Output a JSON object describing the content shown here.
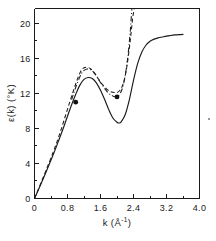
{
  "chart_data": {
    "type": "line",
    "title": "",
    "subtitle": "",
    "xlabel": "k (Å⁻¹)",
    "ylabel": "ε(k) (°K)",
    "xlabel_main": "k (Å",
    "xlabel_sup": "-1",
    "xlabel_tail": ")",
    "ylabel_main": "ε(k)  (°K)",
    "xlim": [
      0,
      4.0
    ],
    "ylim": [
      0,
      21.7
    ],
    "grid": false,
    "legend": "none",
    "xticks": [
      0,
      0.8,
      1.6,
      2.4,
      3.2,
      4.0
    ],
    "xticklabels": [
      "0",
      "0.8",
      "1.6",
      "2.4",
      "3.2",
      "4.0"
    ],
    "yticks": [
      0,
      4,
      8,
      12,
      16,
      20
    ],
    "yticklabels": [
      "0",
      "4",
      "8",
      "12",
      "16",
      "20"
    ],
    "minor_xticks": [
      0.4,
      1.2,
      2.0,
      2.8,
      3.6
    ],
    "minor_yticks": [
      2,
      6,
      10,
      14,
      18
    ],
    "series": [
      {
        "name": "solid-curve",
        "style": "solid",
        "points": [
          [
            0.0,
            0.0
          ],
          [
            0.1,
            1.05
          ],
          [
            0.2,
            2.15
          ],
          [
            0.3,
            3.25
          ],
          [
            0.4,
            4.4
          ],
          [
            0.5,
            5.55
          ],
          [
            0.6,
            6.8
          ],
          [
            0.7,
            8.05
          ],
          [
            0.8,
            9.4
          ],
          [
            0.9,
            10.7
          ],
          [
            1.0,
            11.9
          ],
          [
            1.1,
            12.95
          ],
          [
            1.2,
            13.6
          ],
          [
            1.3,
            13.82
          ],
          [
            1.4,
            13.7
          ],
          [
            1.5,
            13.2
          ],
          [
            1.6,
            12.35
          ],
          [
            1.7,
            11.3
          ],
          [
            1.8,
            10.15
          ],
          [
            1.9,
            9.2
          ],
          [
            2.0,
            8.7
          ],
          [
            2.05,
            8.62
          ],
          [
            2.1,
            8.75
          ],
          [
            2.2,
            9.6
          ],
          [
            2.3,
            11.3
          ],
          [
            2.4,
            13.5
          ],
          [
            2.5,
            15.4
          ],
          [
            2.6,
            16.7
          ],
          [
            2.7,
            17.5
          ],
          [
            2.8,
            17.95
          ],
          [
            2.9,
            18.2
          ],
          [
            3.0,
            18.35
          ],
          [
            3.1,
            18.45
          ],
          [
            3.2,
            18.55
          ],
          [
            3.3,
            18.62
          ],
          [
            3.4,
            18.68
          ],
          [
            3.5,
            18.72
          ],
          [
            3.6,
            18.75
          ]
        ]
      },
      {
        "name": "dashed-curve",
        "style": "dashed",
        "points": [
          [
            0.0,
            0.0
          ],
          [
            0.15,
            1.7
          ],
          [
            0.3,
            3.45
          ],
          [
            0.45,
            5.25
          ],
          [
            0.55,
            6.55
          ],
          [
            0.65,
            7.95
          ],
          [
            0.75,
            9.45
          ],
          [
            0.85,
            10.95
          ],
          [
            0.95,
            12.4
          ],
          [
            1.05,
            13.75
          ],
          [
            1.15,
            14.75
          ],
          [
            1.25,
            15.0
          ],
          [
            1.35,
            14.85
          ],
          [
            1.45,
            14.35
          ],
          [
            1.55,
            13.65
          ],
          [
            1.65,
            13.0
          ],
          [
            1.75,
            12.5
          ],
          [
            1.85,
            12.2
          ],
          [
            1.95,
            12.1
          ],
          [
            2.02,
            12.15
          ],
          [
            2.1,
            12.55
          ],
          [
            2.18,
            13.6
          ],
          [
            2.25,
            15.4
          ],
          [
            2.32,
            18.0
          ],
          [
            2.38,
            20.6
          ],
          [
            2.42,
            21.7
          ]
        ]
      },
      {
        "name": "dash-dot-curve",
        "style": "dashdot",
        "points": [
          [
            0.9,
            11.3
          ],
          [
            1.0,
            12.7
          ],
          [
            1.1,
            13.9
          ],
          [
            1.18,
            14.55
          ],
          [
            1.28,
            14.8
          ],
          [
            1.38,
            14.65
          ],
          [
            1.48,
            14.15
          ],
          [
            1.58,
            13.4
          ],
          [
            1.68,
            12.7
          ],
          [
            1.78,
            12.1
          ],
          [
            1.88,
            11.75
          ],
          [
            1.96,
            11.62
          ],
          [
            2.04,
            11.75
          ],
          [
            2.12,
            12.45
          ],
          [
            2.19,
            13.8
          ],
          [
            2.26,
            16.1
          ],
          [
            2.32,
            19.0
          ],
          [
            2.36,
            21.7
          ]
        ]
      }
    ],
    "data_points": [
      {
        "name": "experimental-point-1",
        "x": 1.0,
        "y": 11.0
      },
      {
        "name": "experimental-point-2",
        "x": 2.0,
        "y": 11.6
      }
    ]
  }
}
